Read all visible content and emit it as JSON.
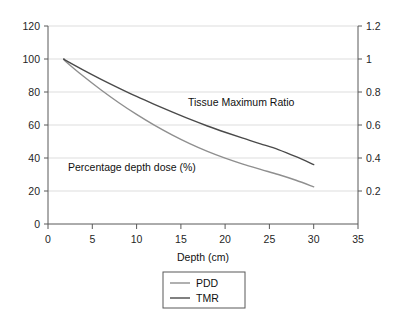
{
  "chart_data": {
    "type": "line",
    "title": "",
    "subtitle": "",
    "xlabel": "Depth (cm)",
    "ylabel": "",
    "y2label": "",
    "xlim": [
      0,
      35
    ],
    "ylim": [
      0,
      120
    ],
    "y2lim": [
      0,
      1.2
    ],
    "grid": "horizontal",
    "legend_position": "below-center",
    "xticks": [
      0,
      5,
      10,
      15,
      20,
      25,
      30,
      35
    ],
    "xtick_labels": [
      "0",
      "5",
      "10",
      "15",
      "20",
      "25",
      "30",
      "35"
    ],
    "yticks": [
      0,
      20,
      40,
      60,
      80,
      100,
      120
    ],
    "ytick_labels": [
      "0",
      "20",
      "40",
      "60",
      "80",
      "100",
      "120"
    ],
    "y2ticks": [
      0.2,
      0.4,
      0.6,
      0.8,
      1.0,
      1.2
    ],
    "y2tick_labels": [
      "0.2",
      "0.4",
      "0.6",
      "0.8",
      "1",
      "1.2"
    ],
    "x": [
      1.8,
      2,
      4,
      6,
      8,
      10,
      12,
      14,
      16,
      18,
      20,
      22,
      24,
      26,
      28,
      30
    ],
    "series": [
      {
        "name": "PDD",
        "legend_label": "PDD",
        "annotation": "Percentage depth dose (%)",
        "color": "#8f8f8f",
        "values": [
          100,
          98.5,
          89.5,
          81.2,
          73.5,
          66.4,
          59.9,
          54.0,
          48.7,
          44.0,
          39.9,
          36.3,
          33.1,
          30.0,
          26.5,
          22.5
        ]
      },
      {
        "name": "TMR",
        "legend_label": "TMR",
        "annotation": "Tissue Maximum Ratio",
        "color": "#4a4a4a",
        "values": [
          100,
          99.2,
          93.3,
          87.7,
          82.4,
          77.3,
          72.5,
          67.9,
          63.5,
          59.4,
          55.6,
          52.0,
          48.6,
          45.1,
          40.8,
          36.0
        ]
      }
    ],
    "annotations": [
      {
        "text": "Tissue Maximum Ratio",
        "x": 17.2,
        "y": 72
      },
      {
        "text": "Percentage depth dose (%)",
        "x": 7.4,
        "y": 44
      }
    ]
  },
  "legend": {
    "items": [
      {
        "label": "PDD",
        "color": "#8f8f8f"
      },
      {
        "label": "TMR",
        "color": "#4a4a4a"
      }
    ]
  },
  "axes": {
    "x_title": "Depth (cm)"
  }
}
